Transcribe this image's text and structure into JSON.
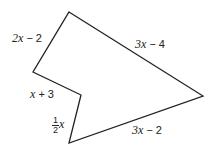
{
  "figure": {
    "type": "polygon",
    "stroke_color": "#222222",
    "vertices": [
      [
        69,
        12
      ],
      [
        203,
        96
      ],
      [
        69,
        143
      ],
      [
        81,
        95
      ],
      [
        33,
        72
      ]
    ],
    "sides": [
      {
        "id": "top_left",
        "label_var": "2x",
        "label_rest": " − 2"
      },
      {
        "id": "top_right",
        "label_var": "3x",
        "label_rest": " − 4"
      },
      {
        "id": "bottom_right",
        "label_var": "3x",
        "label_rest": " − 2"
      },
      {
        "id": "notch_lower",
        "frac_num": "1",
        "frac_den": "2",
        "label_var": "x"
      },
      {
        "id": "notch_upper",
        "label_var": "x",
        "label_rest": " + 3"
      }
    ]
  }
}
